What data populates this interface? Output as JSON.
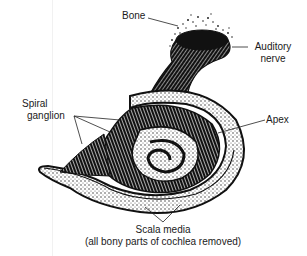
{
  "diagram": {
    "labels": {
      "bone": "Bone",
      "auditory_nerve_line1": "Auditory",
      "auditory_nerve_line2": "nerve",
      "spiral_ganglion_line1": "Spiral",
      "spiral_ganglion_line2": "ganglion",
      "apex": "Apex",
      "scala_media": "Scala media",
      "caption": "(all bony parts of cochlea removed)"
    },
    "colors": {
      "ink": "#111111",
      "paper": "#ffffff"
    }
  }
}
